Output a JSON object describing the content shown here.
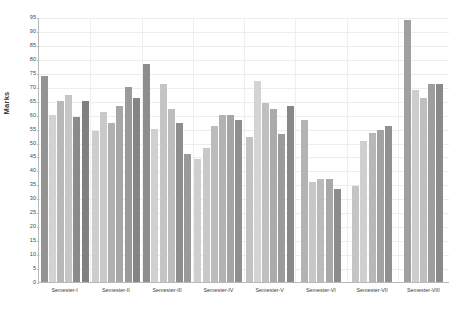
{
  "chart_data": {
    "type": "bar",
    "title": "",
    "xlabel": "",
    "ylabel": "Marks",
    "ylim": [
      0,
      95
    ],
    "ytick_step": 5,
    "yticks": [
      0,
      5,
      10,
      15,
      20,
      25,
      30,
      35,
      40,
      45,
      50,
      55,
      60,
      65,
      70,
      75,
      80,
      85,
      90,
      95
    ],
    "grid": true,
    "legend": "none",
    "categories": [
      "Semester-I",
      "Semester-II",
      "Semester-III",
      "Semester-IV",
      "Semester-V",
      "Semester-VI",
      "Semester-VII",
      "Semester-VIII"
    ],
    "bar_palette": [
      "#8d8d8d",
      "#cfcfcf",
      "#b4b4b4",
      "#a3a3a3",
      "#9a9a9a",
      "#7e7e7e",
      "#c3c3c3",
      "#8a8a8a"
    ],
    "groups": [
      {
        "label": "Semester-I",
        "values": [
          74,
          60,
          65,
          67,
          59,
          65
        ],
        "colors": [
          "#949494",
          "#d2d2d2",
          "#b8b8b8",
          "#c6c6c6",
          "#8b8b8b",
          "#808080"
        ]
      },
      {
        "label": "Semester-II",
        "values": [
          54,
          61,
          57,
          63,
          70,
          66
        ],
        "colors": [
          "#cdcdcd",
          "#c9c9c9",
          "#b0b0b0",
          "#a7a7a7",
          "#9a9a9a",
          "#858585"
        ]
      },
      {
        "label": "Semester-III",
        "values": [
          78,
          55,
          71,
          62,
          57,
          46
        ],
        "colors": [
          "#8d8d8d",
          "#d0d0d0",
          "#c4c4c4",
          "#bdbdbd",
          "#8e8e8e",
          "#9a9a9a"
        ]
      },
      {
        "label": "Semester-IV",
        "values": [
          44,
          48,
          56,
          60,
          60,
          58
        ],
        "colors": [
          "#cfcfcf",
          "#c8c8c8",
          "#bcbcbc",
          "#b2b2b2",
          "#a5a5a5",
          "#8f8f8f"
        ]
      },
      {
        "label": "Semester-V",
        "values": [
          52,
          72,
          64,
          62,
          53,
          63
        ],
        "colors": [
          "#c2c2c2",
          "#d4d4d4",
          "#c0c0c0",
          "#ababab",
          "#9b9b9b",
          "#888888"
        ]
      },
      {
        "label": "Semester-VI",
        "values": [
          58,
          36,
          37,
          37,
          33.5
        ],
        "colors": [
          "#b3b3b3",
          "#c7c7c7",
          "#bbbbbb",
          "#a8a8a8",
          "#8c8c8c"
        ]
      },
      {
        "label": "Semester-VII",
        "values": [
          34.5,
          50.5,
          53.5,
          54.5,
          56
        ],
        "colors": [
          "#c5c5c5",
          "#cfcfcf",
          "#b7b7b7",
          "#a2a2a2",
          "#909090"
        ]
      },
      {
        "label": "Semester-VIII",
        "values": [
          94,
          69,
          66,
          71,
          71
        ],
        "colors": [
          "#a0a0a0",
          "#cdcdcd",
          "#bfbfbf",
          "#9e9e9e",
          "#8a8a8a"
        ]
      }
    ]
  },
  "axis": {
    "y_title": "Marks"
  }
}
